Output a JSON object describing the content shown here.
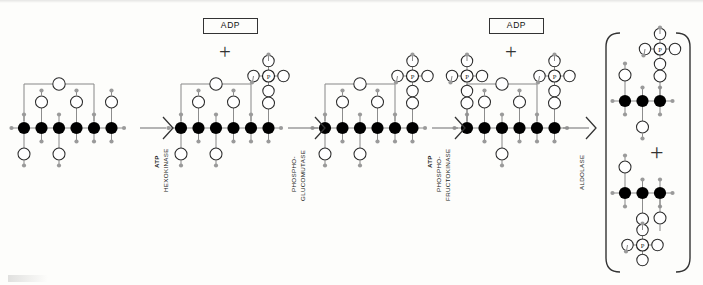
{
  "figure": {
    "type": "biochemical-reaction-diagram",
    "background_color": "#fdfdfb",
    "carbon_color": "#000000",
    "oxygen_color": "#ffffff",
    "hydrogen_color": "#9a9a9a",
    "bond_color": "#8d8d8d",
    "text_color": "#111111"
  },
  "cofactors": [
    {
      "id": "adp1",
      "label": "ADP",
      "plus": "+"
    },
    {
      "id": "adp2",
      "label": "ADP",
      "plus": "+"
    }
  ],
  "arrows": [
    {
      "id": "arrow-hexokinase",
      "lines": [
        "ATP",
        "HEXOKINASE"
      ],
      "bold_lines": [
        "ATP"
      ],
      "substrate_label": "ATP",
      "enzyme_label": "HEXOKINASE"
    },
    {
      "id": "arrow-phosphoglucomutase",
      "lines": [
        "PHOSPHO-",
        "GLUCOMUTASE"
      ],
      "bold_lines": [],
      "substrate_label": "",
      "enzyme_label": "PHOSPHO-GLUCOMUTASE"
    },
    {
      "id": "arrow-phosphofructokinase",
      "lines": [
        "ATP",
        "PHOSPHO-",
        "FRUCTOKINASE"
      ],
      "bold_lines": [
        "ATP"
      ],
      "substrate_label": "ATP",
      "enzyme_label": "PHOSPHO-FRUCTOKINASE"
    },
    {
      "id": "arrow-aldolase",
      "lines": [
        "ALDOLASE"
      ],
      "bold_lines": [],
      "substrate_label": "",
      "enzyme_label": "ALDOLASE"
    }
  ],
  "molecules": [
    {
      "id": "mol-glucose",
      "carbons": 6,
      "phosphates": 0,
      "ring_bridge": true
    },
    {
      "id": "mol-glucose-6-phosphate",
      "carbons": 6,
      "phosphates": 1,
      "ring_bridge": true
    },
    {
      "id": "mol-fructose-6-phosphate",
      "carbons": 6,
      "phosphates": 1,
      "ring_bridge": true
    },
    {
      "id": "mol-fructose-1-6-bisphosphate",
      "carbons": 6,
      "phosphates": 2,
      "ring_bridge": true
    }
  ],
  "products": {
    "bracket": {
      "left": "(",
      "right": ")"
    },
    "plus": "+",
    "items": [
      {
        "id": "product-dihydroxyacetone-phosphate",
        "carbons": 3,
        "phosphates": 1
      },
      {
        "id": "product-glyceraldehyde-3-phosphate",
        "carbons": 3,
        "phosphates": 1
      }
    ]
  },
  "atom_labels": {
    "phosphorus": "P"
  }
}
